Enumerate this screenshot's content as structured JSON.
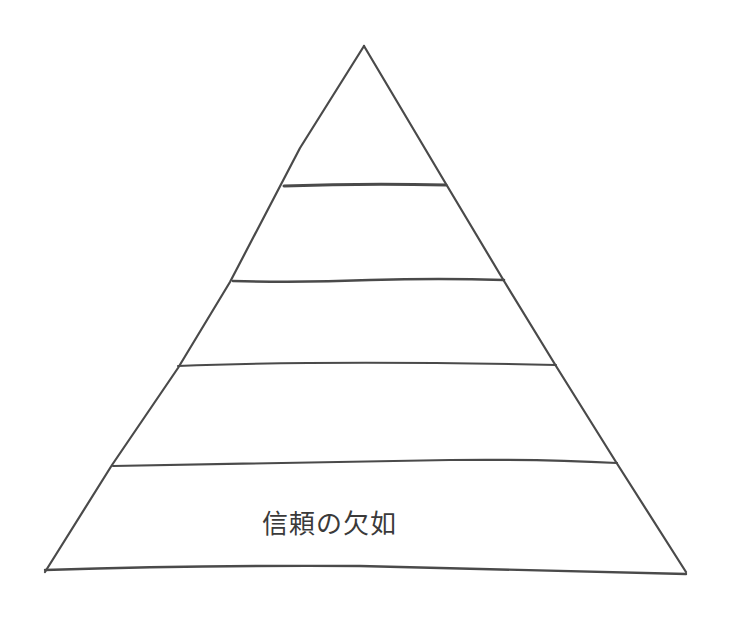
{
  "diagram": {
    "type": "pyramid",
    "style": "hand-drawn pencil sketch",
    "stroke_color": "#4a4a4a",
    "background_color": "#ffffff",
    "layers": [
      {
        "level": 1,
        "position": "top",
        "label": ""
      },
      {
        "level": 2,
        "label": ""
      },
      {
        "level": 3,
        "label": ""
      },
      {
        "level": 4,
        "label": ""
      },
      {
        "level": 5,
        "position": "bottom",
        "label": "信頼の欠如"
      }
    ]
  }
}
